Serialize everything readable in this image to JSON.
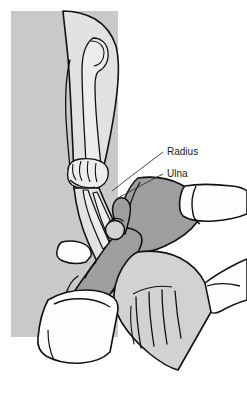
{
  "illustration": {
    "title": "Elbow joint palpation — radius and ulna",
    "subject": "clinical examination of the elbow showing the examiner's thumb palpating the radial head",
    "style": "grayscale medical line drawing"
  },
  "labels": [
    {
      "id": "radius",
      "text": "Radius",
      "x": 167,
      "y": 152
    },
    {
      "id": "ulna",
      "text": "Ulna",
      "x": 167,
      "y": 174
    }
  ],
  "leader_lines": [
    {
      "id": "radius-leader",
      "points": "163,152 118,186 104,196"
    },
    {
      "id": "ulna-leader",
      "points": "163,174 131,190 112,199"
    }
  ],
  "colors": {
    "background_panel": "#c9c9c9",
    "skin_light": "#e2e2e2",
    "skin_mid": "#d2d2d2",
    "skin_dark": "#9e9e9e",
    "bone_light": "#ededed",
    "sleeve_white": "#fdfdfd",
    "outline": "#111111",
    "page": "#ffffff",
    "label_text": "#1a1a1a"
  },
  "regions": [
    {
      "id": "background-panel",
      "name": "gray backdrop panel",
      "tone": "background_panel"
    },
    {
      "id": "patient-upper-arm",
      "name": "patient upper arm",
      "tone": "skin_light"
    },
    {
      "id": "humerus-bone",
      "name": "humerus shaft and condyle",
      "tone": "bone_light"
    },
    {
      "id": "elbow-joint",
      "name": "elbow joint trochlea",
      "tone": "bone_light"
    },
    {
      "id": "patient-forearm",
      "name": "patient forearm",
      "tone": "skin_light"
    },
    {
      "id": "radius-bone",
      "name": "radius bone",
      "tone": "bone_light"
    },
    {
      "id": "ulna-bone",
      "name": "ulna bone",
      "tone": "bone_light"
    },
    {
      "id": "radial-head",
      "name": "radial head",
      "tone": "skin_mid"
    },
    {
      "id": "examiner-hand",
      "name": "examiner hand and thumb",
      "tone": "skin_dark"
    },
    {
      "id": "examiner-forearm",
      "name": "examiner forearm",
      "tone": "skin_dark"
    },
    {
      "id": "examiner-cuff-right",
      "name": "examiner right sleeve cuff",
      "tone": "sleeve_white"
    },
    {
      "id": "examiner-cuff-left",
      "name": "examiner left sleeve cuff",
      "tone": "sleeve_white"
    },
    {
      "id": "patient-hand",
      "name": "patient hand and fingers",
      "tone": "skin_mid"
    },
    {
      "id": "patient-sleeve",
      "name": "patient sleeve cuff",
      "tone": "sleeve_white"
    }
  ]
}
